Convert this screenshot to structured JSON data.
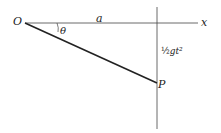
{
  "diagram": {
    "labels": {
      "origin": "O",
      "distance": "a",
      "angle": "θ",
      "x_axis": "x",
      "drop_frac": "½",
      "drop_rest": "gt²",
      "point": "P"
    }
  }
}
